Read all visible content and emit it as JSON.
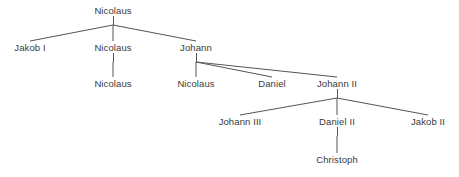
{
  "diagram": {
    "kind": "family-tree",
    "background_color": "#ffffff",
    "edge_color": "#555555",
    "text_color": "#3a3a3a",
    "width": 459,
    "height": 177
  },
  "nodes": [
    {
      "id": "nicolaus-root",
      "label": "Nicolaus",
      "x": 113,
      "y": 11,
      "generation": 1
    },
    {
      "id": "jakob-i",
      "label": "Jakob I",
      "x": 30,
      "y": 48,
      "generation": 2
    },
    {
      "id": "nicolaus-g2",
      "label": "Nicolaus",
      "x": 113,
      "y": 48,
      "generation": 2
    },
    {
      "id": "johann",
      "label": "Johann",
      "x": 196,
      "y": 48,
      "generation": 2
    },
    {
      "id": "nicolaus-g3a",
      "label": "Nicolaus",
      "x": 113,
      "y": 84,
      "generation": 3
    },
    {
      "id": "nicolaus-g3b",
      "label": "Nicolaus",
      "x": 196,
      "y": 84,
      "generation": 3
    },
    {
      "id": "daniel",
      "label": "Daniel",
      "x": 272,
      "y": 84,
      "generation": 3
    },
    {
      "id": "johann-ii",
      "label": "Johann II",
      "x": 337,
      "y": 84,
      "generation": 3
    },
    {
      "id": "johann-iii",
      "label": "Johann III",
      "x": 240,
      "y": 122,
      "generation": 4
    },
    {
      "id": "daniel-ii",
      "label": "Daniel II",
      "x": 337,
      "y": 122,
      "generation": 4
    },
    {
      "id": "jakob-ii",
      "label": "Jakob II",
      "x": 428,
      "y": 122,
      "generation": 4
    },
    {
      "id": "christoph",
      "label": "Christoph",
      "x": 337,
      "y": 160,
      "generation": 5
    }
  ],
  "edges": [
    {
      "from": "nicolaus-root",
      "to": "jakob-i"
    },
    {
      "from": "nicolaus-root",
      "to": "nicolaus-g2"
    },
    {
      "from": "nicolaus-root",
      "to": "johann"
    },
    {
      "from": "nicolaus-g2",
      "to": "nicolaus-g3a"
    },
    {
      "from": "johann",
      "to": "nicolaus-g3b"
    },
    {
      "from": "johann",
      "to": "daniel"
    },
    {
      "from": "johann",
      "to": "johann-ii"
    },
    {
      "from": "johann-ii",
      "to": "johann-iii"
    },
    {
      "from": "johann-ii",
      "to": "daniel-ii"
    },
    {
      "from": "johann-ii",
      "to": "jakob-ii"
    },
    {
      "from": "daniel-ii",
      "to": "christoph"
    }
  ]
}
